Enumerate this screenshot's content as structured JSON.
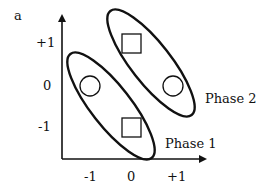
{
  "figure": {
    "panel_label": "a",
    "y_ticks": [
      "+1",
      "0",
      "-1"
    ],
    "x_ticks": [
      "-1",
      "0",
      "+1"
    ],
    "phases": [
      {
        "label": "Phase 1",
        "members": [
          "circle at (-1,0)",
          "square at (0,-1)"
        ]
      },
      {
        "label": "Phase 2",
        "members": [
          "square at (0,+1)",
          "circle at (+1,0)"
        ]
      }
    ],
    "colors": {
      "stroke": "#111111",
      "background": "#ffffff"
    }
  }
}
